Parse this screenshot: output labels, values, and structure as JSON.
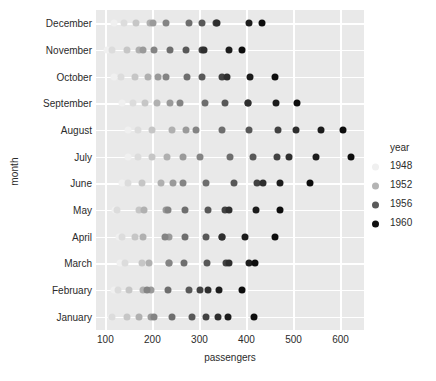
{
  "chart_data": {
    "type": "scatter",
    "title": "",
    "xlabel": "passengers",
    "ylabel": "month",
    "xlim": [
      80,
      650
    ],
    "ylim_categories": [
      "December",
      "November",
      "October",
      "September",
      "August",
      "July",
      "June",
      "May",
      "April",
      "March",
      "February",
      "January"
    ],
    "xticks": [
      100,
      200,
      300,
      400,
      500,
      600
    ],
    "xtick_labels": [
      "100",
      "200",
      "300",
      "400",
      "500",
      "600"
    ],
    "grid": true,
    "background": "#e9e9e9",
    "gridline_color": "#ffffff",
    "legend": {
      "title": "year",
      "position": "right",
      "entries": [
        {
          "label": "1948",
          "color": "#f0f0f0"
        },
        {
          "label": "1952",
          "color": "#b4b4b4"
        },
        {
          "label": "1956",
          "color": "#5a5a5a"
        },
        {
          "label": "1960",
          "color": "#111111"
        }
      ]
    },
    "color_scale": {
      "variable": "year",
      "min_year": 1948,
      "max_year": 1960,
      "min_color": "#f2f2f2",
      "max_color": "#0d0d0d"
    },
    "series": [
      {
        "name": "1949",
        "color": "#f0f0f0",
        "points": [
          {
            "month": "January",
            "passengers": 112
          },
          {
            "month": "February",
            "passengers": 118
          },
          {
            "month": "March",
            "passengers": 132
          },
          {
            "month": "April",
            "passengers": 129
          },
          {
            "month": "May",
            "passengers": 121
          },
          {
            "month": "June",
            "passengers": 135
          },
          {
            "month": "July",
            "passengers": 148
          },
          {
            "month": "August",
            "passengers": 148
          },
          {
            "month": "September",
            "passengers": 136
          },
          {
            "month": "October",
            "passengers": 119
          },
          {
            "month": "November",
            "passengers": 104
          },
          {
            "month": "December",
            "passengers": 118
          }
        ]
      },
      {
        "name": "1950",
        "color": "#dcdcdc",
        "points": [
          {
            "month": "January",
            "passengers": 115
          },
          {
            "month": "February",
            "passengers": 126
          },
          {
            "month": "March",
            "passengers": 141
          },
          {
            "month": "April",
            "passengers": 135
          },
          {
            "month": "May",
            "passengers": 125
          },
          {
            "month": "June",
            "passengers": 149
          },
          {
            "month": "July",
            "passengers": 170
          },
          {
            "month": "August",
            "passengers": 170
          },
          {
            "month": "September",
            "passengers": 158
          },
          {
            "month": "October",
            "passengers": 133
          },
          {
            "month": "November",
            "passengers": 114
          },
          {
            "month": "December",
            "passengers": 140
          }
        ]
      },
      {
        "name": "1951",
        "color": "#c6c6c6",
        "points": [
          {
            "month": "January",
            "passengers": 145
          },
          {
            "month": "February",
            "passengers": 150
          },
          {
            "month": "March",
            "passengers": 178
          },
          {
            "month": "April",
            "passengers": 163
          },
          {
            "month": "May",
            "passengers": 172
          },
          {
            "month": "June",
            "passengers": 178
          },
          {
            "month": "July",
            "passengers": 199
          },
          {
            "month": "August",
            "passengers": 199
          },
          {
            "month": "September",
            "passengers": 184
          },
          {
            "month": "October",
            "passengers": 162
          },
          {
            "month": "November",
            "passengers": 146
          },
          {
            "month": "December",
            "passengers": 166
          }
        ]
      },
      {
        "name": "1952",
        "color": "#b0b0b0",
        "points": [
          {
            "month": "January",
            "passengers": 171
          },
          {
            "month": "February",
            "passengers": 180
          },
          {
            "month": "March",
            "passengers": 193
          },
          {
            "month": "April",
            "passengers": 181
          },
          {
            "month": "May",
            "passengers": 183
          },
          {
            "month": "June",
            "passengers": 218
          },
          {
            "month": "July",
            "passengers": 230
          },
          {
            "month": "August",
            "passengers": 242
          },
          {
            "month": "September",
            "passengers": 209
          },
          {
            "month": "October",
            "passengers": 191
          },
          {
            "month": "November",
            "passengers": 172
          },
          {
            "month": "December",
            "passengers": 194
          }
        ]
      },
      {
        "name": "1953",
        "color": "#9a9a9a",
        "points": [
          {
            "month": "January",
            "passengers": 196
          },
          {
            "month": "February",
            "passengers": 196
          },
          {
            "month": "March",
            "passengers": 236
          },
          {
            "month": "April",
            "passengers": 235
          },
          {
            "month": "May",
            "passengers": 229
          },
          {
            "month": "June",
            "passengers": 243
          },
          {
            "month": "July",
            "passengers": 264
          },
          {
            "month": "August",
            "passengers": 272
          },
          {
            "month": "September",
            "passengers": 237
          },
          {
            "month": "October",
            "passengers": 211
          },
          {
            "month": "November",
            "passengers": 180
          },
          {
            "month": "December",
            "passengers": 201
          }
        ]
      },
      {
        "name": "1954",
        "color": "#848484",
        "points": [
          {
            "month": "January",
            "passengers": 204
          },
          {
            "month": "February",
            "passengers": 188
          },
          {
            "month": "March",
            "passengers": 235
          },
          {
            "month": "April",
            "passengers": 227
          },
          {
            "month": "May",
            "passengers": 234
          },
          {
            "month": "June",
            "passengers": 264
          },
          {
            "month": "July",
            "passengers": 302
          },
          {
            "month": "August",
            "passengers": 293
          },
          {
            "month": "September",
            "passengers": 259
          },
          {
            "month": "October",
            "passengers": 229
          },
          {
            "month": "November",
            "passengers": 203
          },
          {
            "month": "December",
            "passengers": 229
          }
        ]
      },
      {
        "name": "1955",
        "color": "#6e6e6e",
        "points": [
          {
            "month": "January",
            "passengers": 242
          },
          {
            "month": "February",
            "passengers": 233
          },
          {
            "month": "March",
            "passengers": 267
          },
          {
            "month": "April",
            "passengers": 269
          },
          {
            "month": "May",
            "passengers": 270
          },
          {
            "month": "June",
            "passengers": 315
          },
          {
            "month": "July",
            "passengers": 364
          },
          {
            "month": "August",
            "passengers": 347
          },
          {
            "month": "September",
            "passengers": 312
          },
          {
            "month": "October",
            "passengers": 274
          },
          {
            "month": "November",
            "passengers": 237
          },
          {
            "month": "December",
            "passengers": 278
          }
        ]
      },
      {
        "name": "1956",
        "color": "#585858",
        "points": [
          {
            "month": "January",
            "passengers": 284
          },
          {
            "month": "February",
            "passengers": 277
          },
          {
            "month": "March",
            "passengers": 317
          },
          {
            "month": "April",
            "passengers": 313
          },
          {
            "month": "May",
            "passengers": 318
          },
          {
            "month": "June",
            "passengers": 374
          },
          {
            "month": "July",
            "passengers": 413
          },
          {
            "month": "August",
            "passengers": 405
          },
          {
            "month": "September",
            "passengers": 355
          },
          {
            "month": "October",
            "passengers": 306
          },
          {
            "month": "November",
            "passengers": 271
          },
          {
            "month": "December",
            "passengers": 306
          }
        ]
      },
      {
        "name": "1957",
        "color": "#424242",
        "points": [
          {
            "month": "January",
            "passengers": 315
          },
          {
            "month": "February",
            "passengers": 301
          },
          {
            "month": "March",
            "passengers": 356
          },
          {
            "month": "April",
            "passengers": 348
          },
          {
            "month": "May",
            "passengers": 355
          },
          {
            "month": "June",
            "passengers": 422
          },
          {
            "month": "July",
            "passengers": 465
          },
          {
            "month": "August",
            "passengers": 467
          },
          {
            "month": "September",
            "passengers": 404
          },
          {
            "month": "October",
            "passengers": 347
          },
          {
            "month": "November",
            "passengers": 305
          },
          {
            "month": "December",
            "passengers": 336
          }
        ]
      },
      {
        "name": "1958",
        "color": "#2e2e2e",
        "points": [
          {
            "month": "January",
            "passengers": 340
          },
          {
            "month": "February",
            "passengers": 318
          },
          {
            "month": "March",
            "passengers": 362
          },
          {
            "month": "April",
            "passengers": 348
          },
          {
            "month": "May",
            "passengers": 363
          },
          {
            "month": "June",
            "passengers": 435
          },
          {
            "month": "July",
            "passengers": 491
          },
          {
            "month": "August",
            "passengers": 505
          },
          {
            "month": "September",
            "passengers": 404
          },
          {
            "month": "October",
            "passengers": 359
          },
          {
            "month": "November",
            "passengers": 310
          },
          {
            "month": "December",
            "passengers": 337
          }
        ]
      },
      {
        "name": "1959",
        "color": "#1c1c1c",
        "points": [
          {
            "month": "January",
            "passengers": 360
          },
          {
            "month": "February",
            "passengers": 342
          },
          {
            "month": "March",
            "passengers": 406
          },
          {
            "month": "April",
            "passengers": 396
          },
          {
            "month": "May",
            "passengers": 420
          },
          {
            "month": "June",
            "passengers": 472
          },
          {
            "month": "July",
            "passengers": 548
          },
          {
            "month": "August",
            "passengers": 559
          },
          {
            "month": "September",
            "passengers": 463
          },
          {
            "month": "October",
            "passengers": 407
          },
          {
            "month": "November",
            "passengers": 362
          },
          {
            "month": "December",
            "passengers": 405
          }
        ]
      },
      {
        "name": "1960",
        "color": "#0d0d0d",
        "points": [
          {
            "month": "January",
            "passengers": 417
          },
          {
            "month": "February",
            "passengers": 391
          },
          {
            "month": "March",
            "passengers": 419
          },
          {
            "month": "April",
            "passengers": 461
          },
          {
            "month": "May",
            "passengers": 472
          },
          {
            "month": "June",
            "passengers": 535
          },
          {
            "month": "July",
            "passengers": 622
          },
          {
            "month": "August",
            "passengers": 606
          },
          {
            "month": "September",
            "passengers": 508
          },
          {
            "month": "October",
            "passengers": 461
          },
          {
            "month": "November",
            "passengers": 390
          },
          {
            "month": "December",
            "passengers": 432
          }
        ]
      }
    ]
  }
}
